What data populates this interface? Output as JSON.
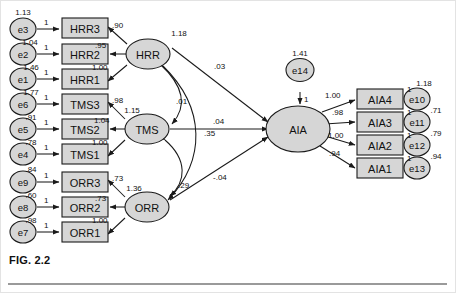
{
  "figure": {
    "caption": "FIG. 2.2",
    "type": "structural-equation-model-path-diagram"
  },
  "observed_variables": [
    {
      "id": "HRR3",
      "label": "HRR3"
    },
    {
      "id": "HRR2",
      "label": "HRR2"
    },
    {
      "id": "HRR1",
      "label": "HRR1"
    },
    {
      "id": "TMS3",
      "label": "TMS3"
    },
    {
      "id": "TMS2",
      "label": "TMS2"
    },
    {
      "id": "TMS1",
      "label": "TMS1"
    },
    {
      "id": "ORR3",
      "label": "ORR3"
    },
    {
      "id": "ORR2",
      "label": "ORR2"
    },
    {
      "id": "ORR1",
      "label": "ORR1"
    },
    {
      "id": "AIA4",
      "label": "AIA4"
    },
    {
      "id": "AIA3",
      "label": "AIA3"
    },
    {
      "id": "AIA2",
      "label": "AIA2"
    },
    {
      "id": "AIA1",
      "label": "AIA1"
    }
  ],
  "latent_variables": [
    {
      "id": "HRR",
      "label": "HRR",
      "variance": "1.18"
    },
    {
      "id": "TMS",
      "label": "TMS",
      "variance": "1.15"
    },
    {
      "id": "ORR",
      "label": "ORR",
      "variance": "1.36"
    },
    {
      "id": "AIA",
      "label": "AIA",
      "variance": ""
    }
  ],
  "error_terms": [
    {
      "id": "e3",
      "label": "e3",
      "variance": "1.13"
    },
    {
      "id": "e2",
      "label": "e2",
      "variance": "1.04"
    },
    {
      "id": "e1",
      "label": "e1",
      "variance": "1.46"
    },
    {
      "id": "e6",
      "label": "e6",
      "variance": "1.77"
    },
    {
      "id": "e5",
      "label": "e5",
      "variance": ".91"
    },
    {
      "id": "e4",
      "label": "e4",
      "variance": ".78"
    },
    {
      "id": "e9",
      "label": "e9",
      "variance": ".84"
    },
    {
      "id": "e8",
      "label": "e8",
      "variance": ".60"
    },
    {
      "id": "e7",
      "label": "e7",
      "variance": ".98"
    },
    {
      "id": "e14",
      "label": "e14",
      "variance": "1.41"
    },
    {
      "id": "e10",
      "label": "e10",
      "variance": "1.18"
    },
    {
      "id": "e11",
      "label": "e11",
      "variance": ".71"
    },
    {
      "id": "e12",
      "label": "e12",
      "variance": ".79"
    },
    {
      "id": "e13",
      "label": "e13",
      "variance": ".94"
    }
  ],
  "loadings": {
    "hrr_to_hrr3": ".90",
    "hrr_to_hrr2": ".95",
    "hrr_to_hrr1": "1.00",
    "tms_to_tms3": ".98",
    "tms_to_tms2": "1.04",
    "tms_to_tms1": "1.00",
    "orr_to_orr3": ".73",
    "orr_to_orr2": ".73",
    "orr_to_orr1": "1.00",
    "aia_to_aia4": "1.00",
    "aia_to_aia3": ".98",
    "aia_to_aia2": "1.00",
    "aia_to_aia1": ".94"
  },
  "error_paths": {
    "fixed_one": "1"
  },
  "structural_paths": [
    {
      "id": "hrr-to-aia",
      "from": "HRR",
      "to": "AIA",
      "estimate": ".03"
    },
    {
      "id": "tms-to-aia",
      "from": "TMS",
      "to": "AIA",
      "estimate": ".04"
    },
    {
      "id": "orr-to-aia",
      "from": "ORR",
      "to": "AIA",
      "estimate": "-.04"
    }
  ],
  "covariances": [
    {
      "id": "hrr-tms-cov",
      "between": "HRR-TMS",
      "estimate": ".01"
    },
    {
      "id": "tms-orr-cov",
      "between": "TMS-ORR",
      "estimate": ".35"
    },
    {
      "id": "hrr-orr-cov",
      "between": "HRR-ORR",
      "estimate": ".29"
    }
  ],
  "colors": {
    "node_fill": "#d6d6d6",
    "stroke": "#1a1a1a",
    "background": "#ffffff",
    "rule": "#9a9a9a"
  }
}
